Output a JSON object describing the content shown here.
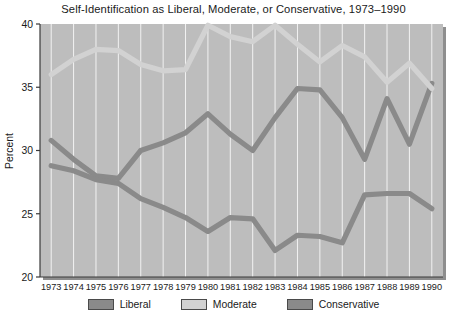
{
  "chart_data": {
    "type": "line",
    "title": "Self-Identification as Liberal, Moderate, or Conservative, 1973–1990",
    "xlabel": "",
    "ylabel": "Percent",
    "x": [
      1973,
      1974,
      1975,
      1976,
      1977,
      1978,
      1979,
      1980,
      1981,
      1982,
      1983,
      1984,
      1985,
      1986,
      1987,
      1988,
      1989,
      1990
    ],
    "categories": [
      "1973",
      "1974",
      "1975",
      "1976",
      "1977",
      "1978",
      "1979",
      "1980",
      "1981",
      "1982",
      "1983",
      "1984",
      "1985",
      "1986",
      "1987",
      "1988",
      "1989",
      "1990"
    ],
    "ylim": [
      20,
      40
    ],
    "yticks": [
      20,
      25,
      30,
      35,
      40
    ],
    "ytick_labels": [
      "20",
      "25",
      "30",
      "35",
      "40"
    ],
    "grid": "vertical",
    "legend_position": "bottom",
    "series": [
      {
        "name": "Liberal",
        "color": "#8a8a8a",
        "values": [
          30.8,
          29.3,
          28.0,
          27.8,
          30.0,
          30.6,
          31.4,
          32.9,
          31.3,
          30.0,
          32.6,
          34.9,
          34.8,
          32.6,
          29.3,
          34.1,
          30.5,
          35.3
        ]
      },
      {
        "name": "Moderate",
        "color": "#d2d2d2",
        "values": [
          36.0,
          37.2,
          38.0,
          37.9,
          36.8,
          36.3,
          36.4,
          39.9,
          39.0,
          38.6,
          39.9,
          38.4,
          37.0,
          38.3,
          37.4,
          35.4,
          36.9,
          34.9
        ]
      },
      {
        "name": "Conservative",
        "color": "#8a8a8a",
        "values": [
          28.8,
          28.4,
          27.7,
          27.4,
          26.2,
          25.5,
          24.7,
          23.6,
          24.7,
          24.6,
          22.1,
          23.3,
          23.2,
          22.7,
          26.5,
          26.6,
          26.6,
          25.4
        ]
      }
    ]
  },
  "legend": {
    "entries": [
      {
        "label": "Liberal",
        "color": "#8a8a8a"
      },
      {
        "label": "Moderate",
        "color": "#d2d2d2"
      },
      {
        "label": "Conservative",
        "color": "#8a8a8a"
      }
    ]
  },
  "colors": {
    "plot_background": "#bdbdbd",
    "gridline": "#f2f2f2",
    "axis": "#3a3a3a",
    "liberal": "#8a8a8a",
    "moderate": "#d2d2d2",
    "conservative": "#8a8a8a",
    "text": "#1a1a1a"
  }
}
